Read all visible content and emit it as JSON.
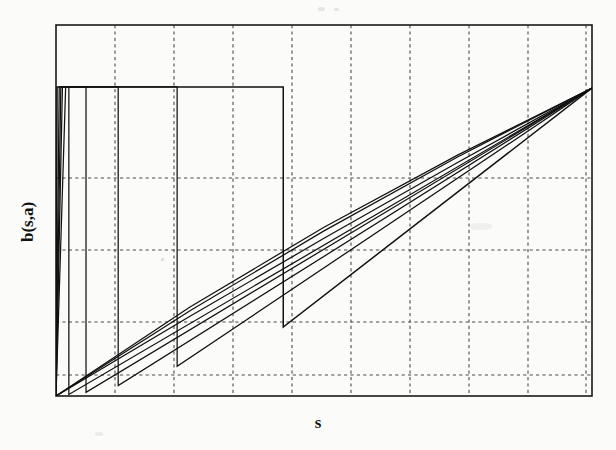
{
  "figure": {
    "name": "bidding-function-plot",
    "background_color": "#fbfbfa",
    "ink_color": "#111111",
    "grid_color": "#4d4d4d"
  },
  "axes": {
    "x_label": "s",
    "y_label": "b(s,a)",
    "frame": {
      "left": 56,
      "right": 592,
      "top": 25,
      "bottom": 396
    },
    "x_gridlines": [
      115,
      174,
      233,
      292,
      351,
      410,
      469,
      528,
      586
    ],
    "y_gridlines": [
      178,
      250,
      322,
      375
    ],
    "grid_style": "dashed",
    "tick_labels_x": [],
    "tick_labels_y": []
  },
  "chart_data": {
    "type": "line",
    "title": "",
    "subtitle": "",
    "xlabel": "s",
    "ylabel": "b(s,a)",
    "xlim": [
      0,
      1
    ],
    "ylim": [
      0,
      1
    ],
    "grid": true,
    "legend": "none",
    "series": [
      {
        "name": "curve-1-plateau-top",
        "description": "Uppermost curve: near-vertical rise at s~0 to the top plateau level, flat plateau, then vertical drop at s~0.42 back to a low level, then linear rise to the top-right corner.",
        "points": [
          [
            0.0,
            0.0
          ],
          [
            0.002,
            0.833
          ],
          [
            0.424,
            0.833
          ],
          [
            0.424,
            0.186
          ],
          [
            1.0,
            0.83
          ]
        ]
      },
      {
        "name": "curve-2",
        "description": "Second curve: vertical rise at s~0.005, plateau, drop at s~0.225, then linear rise to top-right.",
        "points": [
          [
            0.0,
            0.0
          ],
          [
            0.006,
            0.833
          ],
          [
            0.226,
            0.833
          ],
          [
            0.226,
            0.08
          ],
          [
            1.0,
            0.83
          ]
        ]
      },
      {
        "name": "curve-3",
        "description": "Third curve: vertical rise at s~0.012, plateau, drop at s~0.115, then linear rise to top-right.",
        "points": [
          [
            0.0,
            0.0
          ],
          [
            0.012,
            0.833
          ],
          [
            0.116,
            0.833
          ],
          [
            0.116,
            0.028
          ],
          [
            1.0,
            0.83
          ]
        ]
      },
      {
        "name": "curve-4",
        "description": "Fourth curve: vertical rise at s~0.018, plateau, drop at s~0.056, then linear rise to top-right.",
        "points": [
          [
            0.0,
            0.0
          ],
          [
            0.018,
            0.833
          ],
          [
            0.056,
            0.833
          ],
          [
            0.056,
            0.01
          ],
          [
            1.0,
            0.83
          ]
        ]
      },
      {
        "name": "curve-5",
        "description": "Fifth curve: very narrow spike at s~0.009 up to the plateau, dropping almost immediately, then linear rise to the top-right.",
        "points": [
          [
            0.0,
            0.0
          ],
          [
            0.009,
            0.833
          ],
          [
            0.024,
            0.833
          ],
          [
            0.024,
            0.004
          ],
          [
            1.0,
            0.83
          ]
        ]
      },
      {
        "name": "curve-6-limit-diagonal",
        "description": "Limiting smooth curve: rises monotonically from the origin to the common top-right point, lying above the other rising branches.",
        "points": [
          [
            0.0,
            0.0
          ],
          [
            0.25,
            0.215
          ],
          [
            0.5,
            0.425
          ],
          [
            0.75,
            0.63
          ],
          [
            1.0,
            0.83
          ]
        ]
      },
      {
        "name": "curve-7-upper-envelope",
        "description": "Upper envelope diagonal, slightly steeper, joining the origin region to the common top-right point.",
        "points": [
          [
            0.0,
            0.0
          ],
          [
            0.25,
            0.23
          ],
          [
            0.5,
            0.445
          ],
          [
            0.75,
            0.645
          ],
          [
            1.0,
            0.83
          ]
        ]
      },
      {
        "name": "curve-8-topmost-envelope",
        "description": "Topmost of the bundled diagonals.",
        "points": [
          [
            0.0,
            0.0
          ],
          [
            0.25,
            0.24
          ],
          [
            0.5,
            0.455
          ],
          [
            0.75,
            0.65
          ],
          [
            1.0,
            0.83
          ]
        ]
      }
    ]
  }
}
